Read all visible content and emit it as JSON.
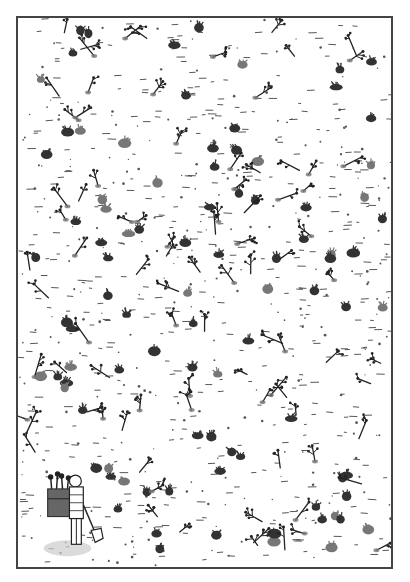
{
  "illustration": {
    "subject": "Field of planted seedlings with a gardener carrying a basket of seedlings and a shovel",
    "style": "pen-and-ink with gray wash",
    "colors": {
      "ink": "#222222",
      "clump": "#333333",
      "clump_light": "#777777",
      "dash": "#555555",
      "border": "#444444",
      "paper": "#ffffff",
      "shadow": "#bbbbbb"
    },
    "elements": {
      "seedlings": "scattered branching sprouts",
      "clumps": "dark grass tufts",
      "ground_marks": "short horizontal dashes and dots",
      "figure": "gardener with basket and shovel"
    }
  }
}
